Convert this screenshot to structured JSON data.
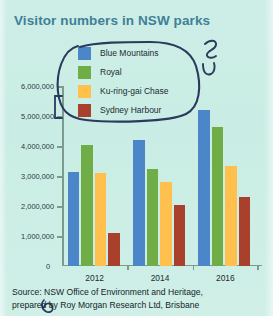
{
  "title": "Visitor numbers in NSW parks",
  "source": {
    "line1": "Source: NSW Office of Environment and Heritage,",
    "line2": "prepared by Roy Morgan Research Ltd, Brisbane"
  },
  "colors": {
    "background": "#cdeee6",
    "title": "#3f7f97",
    "axis": "#7c9a8e",
    "annotation": "#2b3a5c",
    "blue_mountains": "#4a86c8",
    "royal": "#70ad47",
    "kuringgai": "#ffc04d",
    "sydney_harbour": "#a8402c"
  },
  "annotations": {
    "oval_around_legend": "hand-drawn-oval",
    "bracket_left": "hand-drawn-bracket",
    "squiggle_top_right": "hand-drawn-squiggle",
    "hook_right": "hand-drawn-hook",
    "squiggle_bottom_left": "hand-drawn-squiggle"
  },
  "chart_data": {
    "type": "bar",
    "title": "Visitor numbers in NSW parks",
    "xlabel": "",
    "ylabel": "",
    "categories": [
      "2012",
      "2014",
      "2016"
    ],
    "series": [
      {
        "name": "Blue Mountains",
        "color": "#4a86c8",
        "values": [
          3150000,
          4200000,
          5200000
        ]
      },
      {
        "name": "Royal",
        "color": "#70ad47",
        "values": [
          4050000,
          3250000,
          4650000
        ]
      },
      {
        "name": "Ku-ring-gai Chase",
        "color": "#ffc04d",
        "values": [
          3100000,
          2800000,
          3350000
        ]
      },
      {
        "name": "Sydney Harbour",
        "color": "#a8402c",
        "values": [
          1100000,
          2050000,
          2300000
        ]
      }
    ],
    "ylim": [
      0,
      6000000
    ],
    "yticks": [
      0,
      1000000,
      2000000,
      3000000,
      4000000,
      5000000,
      6000000
    ],
    "ytick_labels": [
      "0",
      "1,000,000",
      "2,000,000",
      "3,000,000",
      "4,000,000",
      "5,000,000",
      "6,000,000"
    ],
    "grid": false,
    "legend_position": "top-center"
  }
}
